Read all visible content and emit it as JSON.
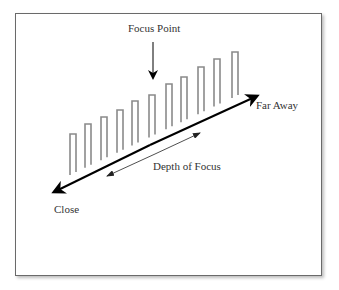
{
  "diagram": {
    "labels": {
      "focus_point": "Focus Point",
      "far_away": "Far Away",
      "close": "Close",
      "depth_of_focus": "Depth of Focus"
    },
    "bars": {
      "count": 11,
      "x": [
        70,
        85,
        101,
        117,
        132,
        149,
        166,
        181,
        198,
        214,
        232
      ],
      "tops": [
        134,
        124,
        117,
        110,
        101,
        95,
        84,
        77,
        67,
        59,
        52
      ],
      "color": "#8a8a8a"
    },
    "colors": {
      "frame": "#6a6a6a",
      "arrow": "#000000",
      "text": "#333333"
    }
  }
}
